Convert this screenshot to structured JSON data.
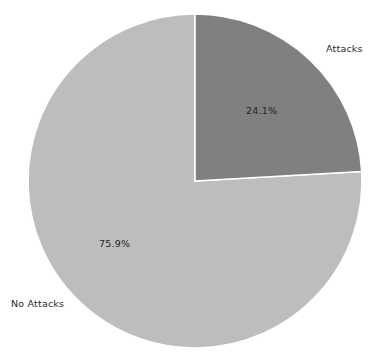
{
  "figure": {
    "background_color": "#ffffff",
    "width": 380,
    "height": 363
  },
  "chart_data": {
    "type": "pie",
    "title": "",
    "subtitle": "",
    "xlabel": "",
    "ylabel": "",
    "legend_position": "none",
    "grid": false,
    "start_angle_deg": 90,
    "direction": "clockwise",
    "center": {
      "x": 195,
      "y": 181
    },
    "radius": 167,
    "labels": [
      "Attacks",
      "No Attacks"
    ],
    "values": [
      24.1,
      75.9
    ],
    "value_labels": [
      "24.1%",
      "75.9%"
    ],
    "colors": [
      "#808080",
      "#bdbdbd"
    ],
    "wedge_edge_color": "#ffffff",
    "slices": [
      {
        "name": "Attacks",
        "value": 24.1,
        "value_label": "24.1%",
        "color": "#808080",
        "label_position": "outside-upper-right",
        "pct_position": "inside"
      },
      {
        "name": "No Attacks",
        "value": 75.9,
        "value_label": "75.9%",
        "color": "#bdbdbd",
        "label_position": "outside-lower-left",
        "pct_position": "inside"
      }
    ]
  }
}
